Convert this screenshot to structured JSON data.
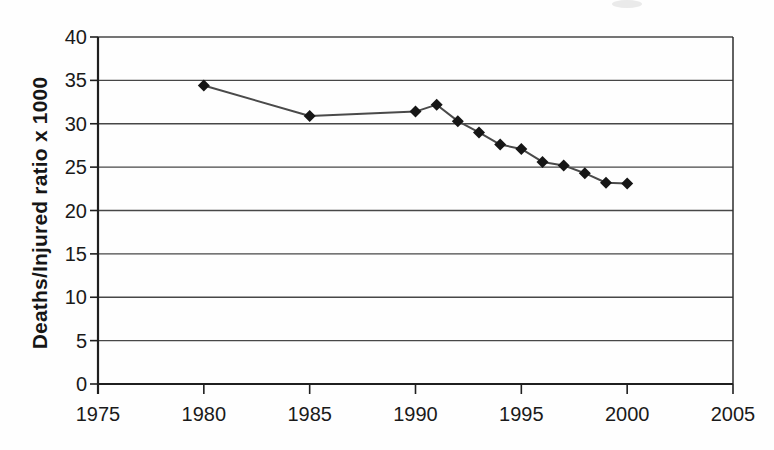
{
  "chart_data": {
    "type": "line",
    "title": "",
    "xlabel": "",
    "ylabel": "Deaths/Injured ratio x 1000",
    "x": [
      1980,
      1985,
      1990,
      1991,
      1992,
      1993,
      1994,
      1995,
      1996,
      1997,
      1998,
      1999,
      2000
    ],
    "series": [
      {
        "name": "Deaths/Injured ratio x 1000",
        "values": [
          34.4,
          30.9,
          31.4,
          32.2,
          30.3,
          29.0,
          27.6,
          27.1,
          25.6,
          25.2,
          24.3,
          23.2,
          23.1
        ]
      }
    ],
    "xlim": [
      1975,
      2005
    ],
    "ylim": [
      0,
      40
    ],
    "x_ticks": [
      1975,
      1980,
      1985,
      1990,
      1995,
      2000,
      2005
    ],
    "y_ticks": [
      0,
      5,
      10,
      15,
      20,
      25,
      30,
      35,
      40
    ],
    "grid": "horizontal",
    "legend_position": "none",
    "marker": "diamond",
    "colors": {
      "line": "#4a4a4a",
      "marker": "#161616",
      "gridline": "#474747",
      "axis": "#1f1f1f",
      "border": "#2e2e2e",
      "text": "#1a1a1a",
      "background": "#fefefe",
      "scan_artifact": "#d9d9d9"
    }
  }
}
